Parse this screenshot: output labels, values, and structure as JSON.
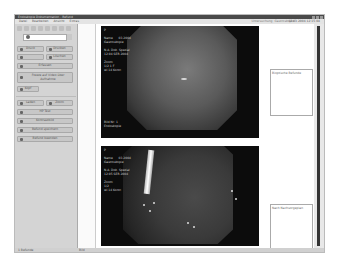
{
  "window": {
    "title": "Endoskopie Dokumentation - Befund",
    "menu": [
      "Datei",
      "Bearbeiten",
      "Ansicht",
      "Extras"
    ],
    "header_info": "Untersuchung: Gastroskopie",
    "date": "12.03.2004 12:15:04"
  },
  "sidebar": {
    "patient_field_value": "",
    "buttons": [
      {
        "label": "Druck",
        "icon": "printer-icon"
      },
      {
        "label": "Drucken",
        "icon": "print-preview-icon"
      },
      {
        "label": "",
        "icon": "arrow-icon"
      },
      {
        "label": "Löschen",
        "icon": "delete-icon"
      },
      {
        "label": "Erfassen",
        "icon": "capture-icon"
      },
      {
        "label": "Freeze auf Video über Aufnahme",
        "icon": "record-icon"
      },
      {
        "label": "Kopf",
        "icon": "header-icon"
      },
      {
        "label": "Laden",
        "icon": "load-icon"
      },
      {
        "label": "Zoom",
        "icon": "zoom-icon"
      },
      {
        "label": "HP Test",
        "icon": "test-icon"
      },
      {
        "label": "Kontrastbild",
        "icon": "contrast-icon"
      },
      {
        "label": "Befund speichern",
        "icon": "save-icon"
      },
      {
        "label": "Befund beenden",
        "icon": "exit-icon"
      }
    ]
  },
  "images": [
    {
      "overlay_top": "P\n\nName      03.2004\nGastroskopie\n\nN.A. Dok. Spezial\n12:04 SER 2004\n\nZoom\n1/2 1 F\nwl 14 Kontr.",
      "overlay_bottom": "Bild Nr: 1\nEndoskopie"
    },
    {
      "overlay_top": "P\n\nName      03.2004\nGastroskopie\n\nN.A. Dok. Spezial\n12:05 SER 2004\n\nZoom\n1/2\nwl 14 Kontr.",
      "overlay_bottom": ""
    }
  ],
  "notes": [
    {
      "label": "Bioptische Befunde"
    },
    {
      "label": "Nach Nachsorgeplan"
    }
  ],
  "statusbar": {
    "text": "1 Befunde",
    "page": "Bild"
  }
}
